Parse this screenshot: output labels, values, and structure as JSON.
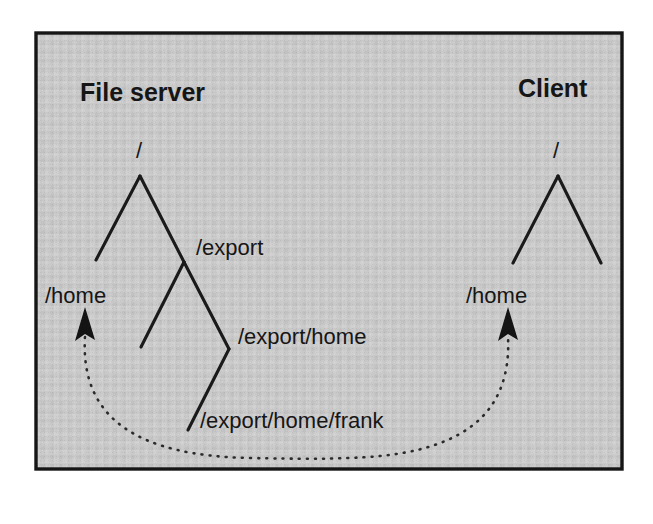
{
  "figure": {
    "kind": "nfs-mount-diagram",
    "background_color": "#ffffff",
    "panel_color": "#c8c8c8",
    "border_color": "#161616",
    "ink_color": "#161616"
  },
  "panels": {
    "server": {
      "title": "File server",
      "root_label": "/",
      "nodes": [
        {
          "label": "/home"
        },
        {
          "label": "/export"
        },
        {
          "label": "/export/home"
        },
        {
          "label": "/export/home/frank"
        }
      ]
    },
    "client": {
      "title": "Client",
      "root_label": "/",
      "nodes": [
        {
          "label": "/home"
        }
      ]
    }
  },
  "connector": {
    "style": "dotted-arc",
    "arrowheads": "both-ends-up",
    "from": "/home",
    "to": "/home"
  }
}
